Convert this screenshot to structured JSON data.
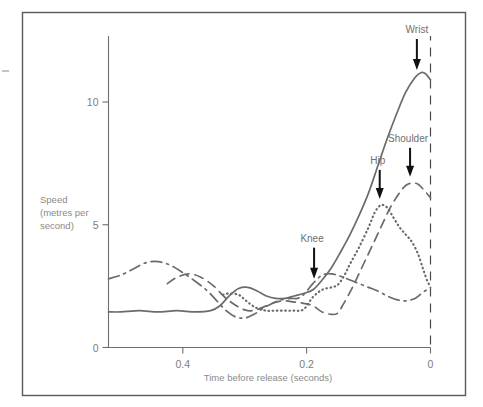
{
  "figure": {
    "name": "speed-vs-time-before-release-chart",
    "background": "#ffffff",
    "frame_color": "#5a5a5a"
  },
  "chart_data": {
    "type": "line",
    "title": "",
    "subtitle": "",
    "xlabel": "Time before release (seconds)",
    "ylabel": "Speed\n(metres per\nsecond)",
    "ylabel_lines": [
      "Speed",
      "(metres per",
      "second)"
    ],
    "xlim": [
      0.52,
      0.0
    ],
    "ylim": [
      0,
      12.2
    ],
    "x_axis_reversed": true,
    "xticks": [
      0.4,
      0.2,
      0
    ],
    "xticklabels": [
      "0.4",
      "0.2",
      "0"
    ],
    "yticks": [
      0,
      5,
      10
    ],
    "yticklabels": [
      "0",
      "5",
      "10"
    ],
    "grid": false,
    "legend": "none (curves labelled inline with arrows)",
    "release_marker": {
      "label": "release (t = 0)",
      "x": 0,
      "style": "dashed vertical line"
    },
    "series": [
      {
        "name": "Wrist",
        "style": "solid",
        "color": "#6b6b6b",
        "x": [
          0.52,
          0.5,
          0.47,
          0.44,
          0.41,
          0.38,
          0.355,
          0.34,
          0.325,
          0.31,
          0.295,
          0.28,
          0.265,
          0.25,
          0.235,
          0.22,
          0.205,
          0.19,
          0.175,
          0.16,
          0.145,
          0.13,
          0.115,
          0.1,
          0.085,
          0.07,
          0.055,
          0.04,
          0.025,
          0.015,
          0.008,
          0.0
        ],
        "y": [
          1.45,
          1.45,
          1.5,
          1.45,
          1.5,
          1.45,
          1.5,
          1.7,
          2.1,
          2.4,
          2.45,
          2.3,
          2.1,
          2.0,
          2.0,
          2.1,
          2.2,
          2.35,
          2.75,
          3.25,
          3.9,
          4.6,
          5.4,
          6.3,
          7.4,
          8.5,
          9.5,
          10.4,
          11.0,
          11.2,
          11.15,
          10.9
        ]
      },
      {
        "name": "Shoulder",
        "style": "dashed",
        "color": "#6b6b6b",
        "x": [
          0.425,
          0.41,
          0.39,
          0.37,
          0.35,
          0.33,
          0.31,
          0.295,
          0.28,
          0.265,
          0.25,
          0.235,
          0.22,
          0.205,
          0.19,
          0.175,
          0.16,
          0.15,
          0.14,
          0.125,
          0.11,
          0.095,
          0.08,
          0.065,
          0.05,
          0.04,
          0.03,
          0.02,
          0.01,
          0.0
        ],
        "y": [
          2.6,
          2.85,
          3.0,
          2.85,
          2.5,
          2.0,
          1.65,
          1.5,
          1.55,
          1.7,
          1.85,
          1.9,
          1.85,
          1.8,
          1.7,
          1.45,
          1.35,
          1.4,
          1.8,
          2.5,
          3.3,
          4.1,
          4.9,
          5.7,
          6.3,
          6.6,
          6.7,
          6.65,
          6.4,
          6.1
        ]
      },
      {
        "name": "Hip",
        "style": "dotted",
        "color": "#6b6b6b",
        "x": [
          0.335,
          0.325,
          0.31,
          0.3,
          0.29,
          0.28,
          0.265,
          0.25,
          0.235,
          0.22,
          0.205,
          0.19,
          0.175,
          0.16,
          0.15,
          0.14,
          0.13,
          0.115,
          0.1,
          0.09,
          0.08,
          0.07,
          0.06,
          0.05,
          0.04,
          0.03,
          0.02,
          0.012,
          0.005,
          0.0
        ],
        "y": [
          2.15,
          2.2,
          2.15,
          1.95,
          1.75,
          1.6,
          1.5,
          1.5,
          1.5,
          1.5,
          1.55,
          2.05,
          2.35,
          2.45,
          2.55,
          2.9,
          3.4,
          4.1,
          4.9,
          5.5,
          5.8,
          5.7,
          5.3,
          4.9,
          4.6,
          4.3,
          3.8,
          3.2,
          2.7,
          2.5
        ]
      },
      {
        "name": "Knee",
        "style": "dash-dot",
        "color": "#6b6b6b",
        "x": [
          0.52,
          0.5,
          0.48,
          0.46,
          0.44,
          0.42,
          0.4,
          0.38,
          0.36,
          0.345,
          0.33,
          0.315,
          0.3,
          0.285,
          0.27,
          0.255,
          0.24,
          0.225,
          0.215,
          0.205,
          0.19,
          0.175,
          0.16,
          0.145,
          0.13,
          0.115,
          0.1,
          0.085,
          0.07,
          0.055,
          0.04,
          0.025,
          0.012,
          0.0
        ],
        "y": [
          2.8,
          2.95,
          3.2,
          3.45,
          3.5,
          3.35,
          3.05,
          2.7,
          2.3,
          1.9,
          1.5,
          1.25,
          1.2,
          1.35,
          1.6,
          1.8,
          1.95,
          2.0,
          2.0,
          2.15,
          2.6,
          2.95,
          3.0,
          2.9,
          2.75,
          2.6,
          2.45,
          2.3,
          2.1,
          1.95,
          1.9,
          2.0,
          2.25,
          2.45
        ]
      }
    ],
    "annotations": [
      {
        "label": "Wrist",
        "series": "Wrist",
        "x": 0.022,
        "y": 11.1,
        "label_dx": 0,
        "label_dy": -42
      },
      {
        "label": "Shoulder",
        "series": "Shoulder",
        "x": 0.033,
        "y": 6.75,
        "label_dx": -2,
        "label_dy": -40
      },
      {
        "label": "Hip",
        "series": "Hip",
        "x": 0.082,
        "y": 5.85,
        "label_dx": -2,
        "label_dy": -40
      },
      {
        "label": "Knee",
        "series": "Knee",
        "x": 0.188,
        "y": 2.6,
        "label_dx": -2,
        "label_dy": -42
      }
    ]
  }
}
